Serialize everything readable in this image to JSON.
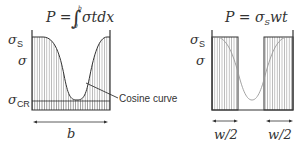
{
  "left_diagram": {
    "equation": "P = ∫₀ᵇ σt dx",
    "eq_P": "P =",
    "eq_integrand": "σtdx",
    "eq_upper": "b",
    "eq_lower": "0",
    "label_sigma_s": "σ",
    "label_sigma_s_sub": "S",
    "label_sigma": "σ",
    "label_sigma_cr": "σ",
    "label_sigma_cr_sub": "CR",
    "callout": "Cosine curve",
    "width_label": "b"
  },
  "right_diagram": {
    "eq_P": "P = σ",
    "eq_sub": "S",
    "eq_tail": "wt",
    "label_sigma_s": "σ",
    "label_sigma_s_sub": "S",
    "label_sigma": "σ",
    "width_label_left": "w/2",
    "width_label_right": "w/2"
  },
  "colors": {
    "line": "#333333",
    "hatch": "#888888",
    "curve_right": "#999999"
  }
}
